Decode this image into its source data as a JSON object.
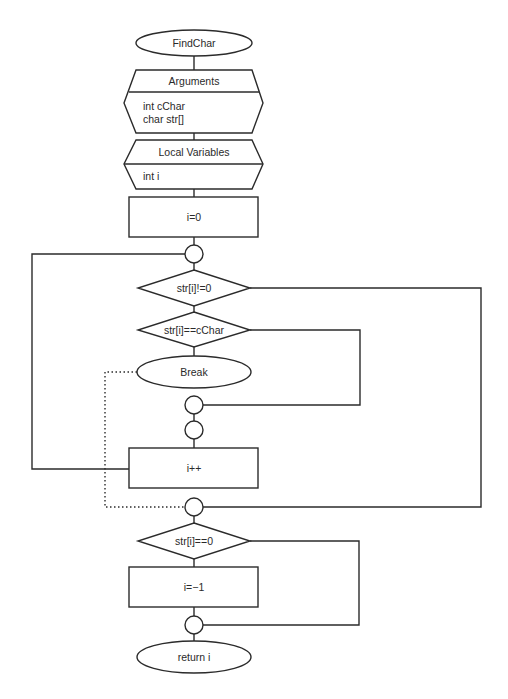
{
  "diagram": {
    "type": "flowchart",
    "stroke_color": "#2b2b2b",
    "background": "#ffffff",
    "nodes": {
      "start": {
        "shape": "terminator",
        "label": "FindChar"
      },
      "arguments": {
        "shape": "hexagon-block",
        "header": "Arguments",
        "lines": [
          "int cChar",
          "char str[]"
        ]
      },
      "locals": {
        "shape": "hexagon-block",
        "header": "Local Variables",
        "lines": [
          "int i"
        ]
      },
      "init": {
        "shape": "process",
        "label": "i=0"
      },
      "loop_join": {
        "shape": "connector",
        "label": ""
      },
      "loop_cond": {
        "shape": "decision",
        "label": "str[i]!=0"
      },
      "match_cond": {
        "shape": "decision",
        "label": "str[i]==cChar"
      },
      "break": {
        "shape": "terminator",
        "label": "Break"
      },
      "if_join": {
        "shape": "connector",
        "label": ""
      },
      "body_join": {
        "shape": "connector",
        "label": ""
      },
      "increment": {
        "shape": "process",
        "label": "i++"
      },
      "loop_exit": {
        "shape": "connector",
        "label": ""
      },
      "end_cond": {
        "shape": "decision",
        "label": "str[i]==0"
      },
      "not_found": {
        "shape": "process",
        "label": "i=−1"
      },
      "final_join": {
        "shape": "connector",
        "label": ""
      },
      "end": {
        "shape": "terminator",
        "label": "return i"
      }
    },
    "edges": [
      {
        "from": "start",
        "to": "arguments",
        "style": "solid"
      },
      {
        "from": "arguments",
        "to": "locals",
        "style": "solid"
      },
      {
        "from": "locals",
        "to": "init",
        "style": "solid"
      },
      {
        "from": "init",
        "to": "loop_join",
        "style": "solid"
      },
      {
        "from": "loop_join",
        "to": "loop_cond",
        "style": "solid"
      },
      {
        "from": "loop_cond",
        "to": "match_cond",
        "style": "solid"
      },
      {
        "from": "loop_cond",
        "to": "loop_exit",
        "style": "solid",
        "route": "right-outer"
      },
      {
        "from": "match_cond",
        "to": "break",
        "style": "solid"
      },
      {
        "from": "match_cond",
        "to": "if_join",
        "style": "solid",
        "route": "right-inner"
      },
      {
        "from": "break",
        "to": "loop_exit",
        "style": "dotted",
        "route": "left-inner"
      },
      {
        "from": "if_join",
        "to": "body_join",
        "style": "solid"
      },
      {
        "from": "body_join",
        "to": "increment",
        "style": "solid"
      },
      {
        "from": "increment",
        "to": "loop_join",
        "style": "solid",
        "route": "left-outer"
      },
      {
        "from": "loop_exit",
        "to": "end_cond",
        "style": "solid"
      },
      {
        "from": "end_cond",
        "to": "not_found",
        "style": "solid"
      },
      {
        "from": "end_cond",
        "to": "final_join",
        "style": "solid",
        "route": "right"
      },
      {
        "from": "not_found",
        "to": "final_join",
        "style": "solid"
      },
      {
        "from": "final_join",
        "to": "end",
        "style": "solid"
      }
    ]
  }
}
